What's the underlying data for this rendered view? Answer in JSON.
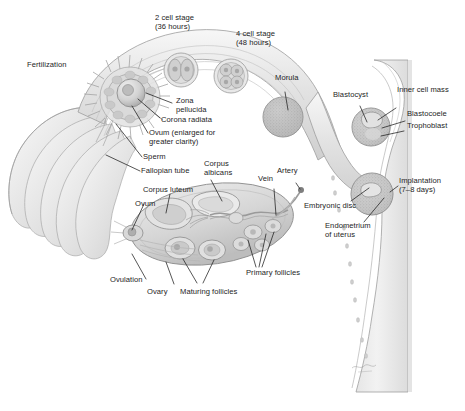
{
  "figure": {
    "type": "anatomical-illustration",
    "style": "grayscale medical illustration",
    "background_color": "#ffffff",
    "text_color": "#1d1d1d",
    "signature": "artist-signature"
  },
  "labels": {
    "fertilization": "Fertilization",
    "two_cell": "2 cell stage\n(36 hours)",
    "four_cell": "4 cell stage\n(48 hours)",
    "morula": "Morula",
    "blastocyst": "Blastocyst",
    "inner_cell_mass": "Inner cell mass",
    "blastocoele": "Blastocoele",
    "trophoblast": "Trophoblast",
    "zona_pellucida": "Zona\npellucida",
    "corona_radiata": "Corona radiata",
    "ovum_enlarged": "Ovum (enlarged for\ngreater clarity)",
    "sperm": "Sperm",
    "fallopian_tube": "Fallopian tube",
    "corpus_luteum": "Corpus luteum",
    "corpus_albicans": "Corpus\nalbicans",
    "ovum": "Ovum",
    "vein": "Vein",
    "artery": "Artery",
    "implantation": "Implantation\n(7–8 days)",
    "embryonic_disc": "Embryonic disc",
    "endometrium": "Endometrium\nof uterus",
    "ovulation": "Ovulation",
    "ovary": "Ovary",
    "maturing_follicles": "Maturing follicles",
    "primary_follicles": "Primary follicles"
  },
  "structures": [
    {
      "name": "fimbriae",
      "label": null
    },
    {
      "name": "fallopian-tube",
      "label": "Fallopian tube"
    },
    {
      "name": "ovary",
      "label": "Ovary"
    },
    {
      "name": "uterus",
      "label": "Endometrium of uterus"
    },
    {
      "name": "ovum-fertilized",
      "label": "Ovum (enlarged for greater clarity)"
    },
    {
      "name": "two-cell-embryo",
      "label": "2 cell stage (36 hours)"
    },
    {
      "name": "four-cell-embryo",
      "label": "4 cell stage (48 hours)"
    },
    {
      "name": "morula-cell",
      "label": "Morula"
    },
    {
      "name": "blastocyst-cell",
      "label": "Blastocyst"
    },
    {
      "name": "implanting-blastocyst",
      "label": "Implantation (7–8 days)"
    }
  ],
  "colors": {
    "outline": "#8e8e8e",
    "tissue_light": "#efefef",
    "tissue_mid": "#dcdcdc",
    "tissue_dark": "#c2c2c2",
    "cell_fill": "#cfcfcf",
    "leader_line": "#1d1d1d"
  }
}
